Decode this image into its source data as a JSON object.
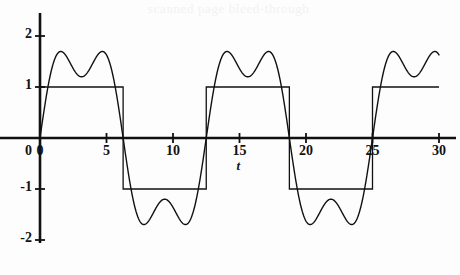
{
  "figure": {
    "background_color": "#fdfdfd",
    "ink_color": "#111111",
    "ghost_overlay_text": "scanned page bleed-through",
    "ghost_overlay_color": "#f2f2f3"
  },
  "chart_data": {
    "type": "line",
    "title": "",
    "subtitle": "",
    "xlabel": "t",
    "ylabel": "",
    "xlim": [
      0,
      30
    ],
    "ylim": [
      -2.55,
      2.55
    ],
    "grid": false,
    "legend": "none",
    "xticks": [
      0,
      5,
      10,
      15,
      20,
      25,
      30
    ],
    "xtick_labels": [
      "0",
      "5",
      "10",
      "15",
      "20",
      "25",
      "30"
    ],
    "yticks": [
      2,
      1,
      -1,
      -2
    ],
    "ytick_labels": [
      "2",
      "1",
      "-1",
      "-2"
    ],
    "origin_label": "0",
    "annotations": [
      {
        "text": "t",
        "x": 15,
        "y": -0.35,
        "role": "x-axis-title"
      }
    ],
    "square_wave_period": 12.5,
    "square_wave_amplitude": 1,
    "approximation_peak": 2.35,
    "approximation_trough": -2.35,
    "approximation_bump_peak": 0.5,
    "series": [
      {
        "name": "square wave",
        "kind": "step",
        "amplitude": 1,
        "period": 12.5,
        "color": "#111111",
        "linewidth": 1.2,
        "points": [
          [
            0,
            1
          ],
          [
            6.25,
            1
          ],
          [
            6.25,
            -1
          ],
          [
            12.5,
            -1
          ],
          [
            12.5,
            1
          ],
          [
            18.75,
            1
          ],
          [
            18.75,
            -1
          ],
          [
            25,
            -1
          ],
          [
            25,
            1
          ],
          [
            30,
            1
          ]
        ]
      },
      {
        "name": "fourier partial sum",
        "kind": "smooth",
        "color": "#111111",
        "linewidth": 1.2,
        "formula_terms": [
          {
            "harmonic": 1,
            "coefficient": 1.8,
            "period": 12.5
          },
          {
            "harmonic": 3,
            "coefficient": 0.6,
            "period": 12.5
          }
        ],
        "samples": 1200,
        "key_points": [
          [
            0,
            0
          ],
          [
            2.8,
            2.35
          ],
          [
            5.6,
            0.0
          ],
          [
            6.6,
            -0.42
          ],
          [
            7.6,
            0.5
          ],
          [
            9.1,
            -2.35
          ],
          [
            12.5,
            0.0
          ],
          [
            15.3,
            2.35
          ],
          [
            18.1,
            0.0
          ],
          [
            19.1,
            -0.42
          ],
          [
            20.1,
            0.5
          ],
          [
            21.6,
            -2.35
          ],
          [
            25.0,
            0.0
          ],
          [
            27.8,
            2.35
          ],
          [
            30.0,
            0.18
          ]
        ]
      }
    ]
  },
  "axes_geometry": {
    "x_axis_pixel_y": 138,
    "y_axis_pixel_x": 40,
    "pixels_per_x_unit": 13.3,
    "pixels_per_y_unit": 51
  }
}
